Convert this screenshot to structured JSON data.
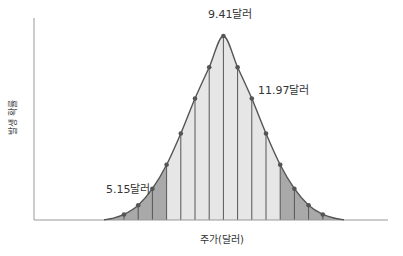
{
  "chart_data": {
    "type": "area",
    "title": "",
    "xlabel": "주가(달러)",
    "ylabel": "발생 확률",
    "grid": false,
    "legend": null,
    "annotations": [
      {
        "text": "9.41달러",
        "anchor_index": 7
      },
      {
        "text": "11.97달러",
        "anchor_index": 9
      },
      {
        "text": "5.15달러",
        "anchor_index": 2
      }
    ],
    "x_index": [
      0,
      1,
      2,
      3,
      4,
      5,
      6,
      7,
      8,
      9,
      10,
      11,
      12,
      13,
      14
    ],
    "values": [
      0.03,
      0.08,
      0.17,
      0.3,
      0.47,
      0.66,
      0.83,
      1.0,
      0.83,
      0.66,
      0.47,
      0.3,
      0.17,
      0.08,
      0.03
    ],
    "shading": {
      "tail_indices_left": [
        0,
        1,
        2,
        3
      ],
      "tail_indices_right": [
        11,
        12,
        13,
        14
      ],
      "tail_color": "#a9a9a9",
      "center_color": "#e6e6e6"
    },
    "line_color": "#555555",
    "point_color": "#555555"
  },
  "labels": {
    "peak": "9.41달러",
    "upper": "11.97달러",
    "lower": "5.15달러",
    "xaxis": "주가(달러)",
    "yaxis": "발생 확률"
  }
}
